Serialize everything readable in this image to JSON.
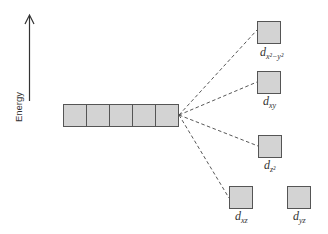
{
  "diagram": {
    "axis": {
      "label": "Energy",
      "direction": "up"
    },
    "degenerate_set": {
      "count": 5
    },
    "orbitals": [
      {
        "id": "dx2-y2",
        "base": "d",
        "subscript": "x²−y²"
      },
      {
        "id": "dxy",
        "base": "d",
        "subscript": "xy"
      },
      {
        "id": "dz2",
        "base": "d",
        "subscript": "z²"
      },
      {
        "id": "dxz",
        "base": "d",
        "subscript": "xz"
      },
      {
        "id": "dyz",
        "base": "d",
        "subscript": "yz"
      }
    ],
    "colors": {
      "box_fill": "#d3d3d3",
      "box_stroke": "#555555",
      "line": "#444444"
    }
  }
}
